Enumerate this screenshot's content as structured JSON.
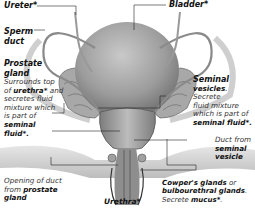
{
  "diagram": {
    "type": "anatomical illustration",
    "colors": {
      "tissue": "#9a9a9a",
      "tissue_dark": "#555555",
      "leader_line": "#222222",
      "text": "#222222"
    }
  },
  "labels": {
    "ureter": {
      "title": "Ureter*"
    },
    "bladder": {
      "title": "Bladder*"
    },
    "sperm_duct": {
      "title_1": "Sperm",
      "title_2": "duct"
    },
    "prostate": {
      "title_1": "Prostate",
      "title_2": "gland",
      "desc_1": "Surrounds top",
      "desc_2a": "of ",
      "desc_2b": "urethra*",
      "desc_2c": " and",
      "desc_3": "secretes fluid",
      "desc_4": "mixture which",
      "desc_5": "is part of",
      "desc_6": "seminal",
      "desc_7": "fluid*."
    },
    "seminal_vesicles": {
      "title_1": "Seminal",
      "title_2": "vesicles",
      "desc_1": "Secrete",
      "desc_2": "fluid mixture",
      "desc_3": "which is part of",
      "desc_4": "seminal fluid*."
    },
    "vesicle_duct": {
      "line_1": "Duct from",
      "line_2": "seminal",
      "line_3": "vesicle"
    },
    "prostate_opening": {
      "line_1": "Opening of duct",
      "line_2a": "from ",
      "line_2b": "prostate",
      "line_3": "gland"
    },
    "urethra": {
      "title": "Urethra*"
    },
    "cowpers": {
      "title_1": "Cowper's glands",
      "or": " or",
      "title_2": "bulbourethral glands",
      "desc_a": "Secrete ",
      "desc_b": "mucus*",
      "desc_c": "."
    }
  }
}
